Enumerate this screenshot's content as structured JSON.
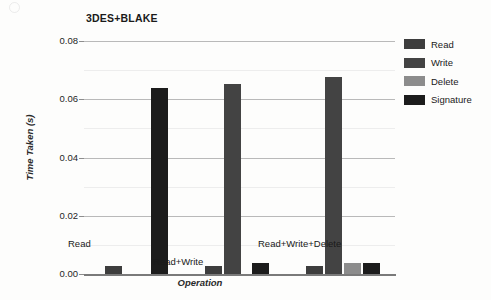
{
  "chart_data": {
    "type": "bar",
    "title": "3DES+BLAKE",
    "xlabel": "Operation",
    "ylabel": "Time Taken (s)",
    "categories": [
      "Read",
      "Read+Write",
      "Read+Write+Delete"
    ],
    "ylim": [
      0.0,
      0.08
    ],
    "yticks": [
      "0.00",
      "0.02",
      "0.04",
      "0.06",
      "0.08"
    ],
    "ytick_values": [
      0.0,
      0.02,
      0.04,
      0.06,
      0.08
    ],
    "grid": true,
    "legend_position": "right",
    "series": [
      {
        "name": "Read",
        "color": "#3d3d3d",
        "values": [
          0.0027,
          0.0027,
          0.0027
        ]
      },
      {
        "name": "Write",
        "color": "#434343",
        "values": [
          null,
          0.0654,
          0.0675
        ]
      },
      {
        "name": "Delete",
        "color": "#8c8c8c",
        "values": [
          null,
          null,
          0.0038
        ]
      },
      {
        "name": "Signature",
        "color": "#1c1c1c",
        "values": [
          0.064,
          0.0038,
          0.0038
        ]
      }
    ],
    "bars": [
      {
        "group": 0,
        "group_label": "Read",
        "series": "Read",
        "value": 0.0027,
        "color": "#3d3d3d",
        "x": 21,
        "w": 17
      },
      {
        "group": 0,
        "group_label": "Read",
        "series": "Signature",
        "value": 0.064,
        "color": "#1c1c1c",
        "x": 67,
        "w": 17
      },
      {
        "group": 1,
        "group_label": "Read+Write",
        "series": "Read",
        "value": 0.0027,
        "color": "#3d3d3d",
        "x": 121,
        "w": 17
      },
      {
        "group": 1,
        "group_label": "Read+Write",
        "series": "Write",
        "value": 0.0654,
        "color": "#434343",
        "x": 140,
        "w": 17
      },
      {
        "group": 1,
        "group_label": "Read+Write",
        "series": "Signature",
        "value": 0.0038,
        "color": "#1c1c1c",
        "x": 168,
        "w": 17
      },
      {
        "group": 2,
        "group_label": "Read+Write+Delete",
        "series": "Read",
        "value": 0.0027,
        "color": "#3d3d3d",
        "x": 222,
        "w": 17
      },
      {
        "group": 2,
        "group_label": "Read+Write+Delete",
        "series": "Write",
        "value": 0.0675,
        "color": "#434343",
        "x": 241,
        "w": 17
      },
      {
        "group": 2,
        "group_label": "Read+Write+Delete",
        "series": "Delete",
        "value": 0.0038,
        "color": "#8c8c8c",
        "x": 260,
        "w": 17
      },
      {
        "group": 2,
        "group_label": "Read+Write+Delete",
        "series": "Signature",
        "value": 0.0038,
        "color": "#1c1c1c",
        "x": 279,
        "w": 17
      }
    ],
    "category_label_layout": [
      {
        "label": "Read",
        "left": 68,
        "top": 238
      },
      {
        "label": "Read+Write",
        "left": 153,
        "top": 256
      },
      {
        "label": "Read+Write+Delete",
        "left": 258,
        "top": 238
      }
    ]
  },
  "legend": {
    "items": [
      {
        "label": "Read",
        "color": "#3d3d3d"
      },
      {
        "label": "Write",
        "color": "#434343"
      },
      {
        "label": "Delete",
        "color": "#8c8c8c"
      },
      {
        "label": "Signature",
        "color": "#1c1c1c"
      }
    ]
  }
}
